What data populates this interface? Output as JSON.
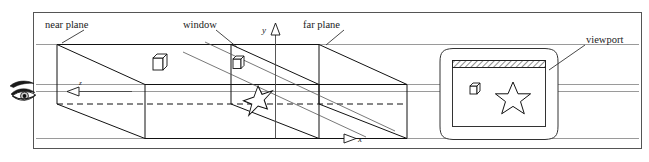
{
  "figure": {
    "border_color": "#555555",
    "line_color": "#111111",
    "guide_color": "#777777",
    "background": "#ffffff"
  },
  "labels": {
    "near_plane": "near plane",
    "window": "window",
    "far_plane": "far plane",
    "viewport": "viewport"
  },
  "axes": {
    "x": "x",
    "y": "y",
    "z": "z"
  },
  "icons": {
    "eye": "eye-icon",
    "cube_near": "cube-icon",
    "cube_window": "cube-icon",
    "star_scene": "star-icon",
    "cube_viewport": "cube-icon",
    "star_viewport": "star-icon",
    "monitor": "monitor-icon",
    "titlebar": "hatched-titlebar"
  }
}
